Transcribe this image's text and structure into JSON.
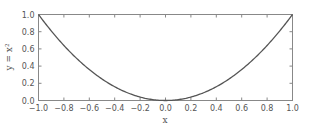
{
  "chart_data": {
    "type": "line",
    "title": "",
    "xlabel": "x",
    "ylabel": "y = x²",
    "xlim": [
      -1.0,
      1.0
    ],
    "ylim": [
      0.0,
      1.0
    ],
    "grid": false,
    "legend": null,
    "x_ticks": [
      "-1.0",
      "-0.8",
      "-0.6",
      "-0.4",
      "-0.2",
      "0.0",
      "0.2",
      "0.4",
      "0.6",
      "0.8",
      "1.0"
    ],
    "y_ticks": [
      "0.0",
      "0.2",
      "0.4",
      "0.6",
      "0.8",
      "1.0"
    ],
    "series": [
      {
        "name": "y = x^2",
        "x": [
          -1.0,
          -0.9,
          -0.8,
          -0.7,
          -0.6,
          -0.5,
          -0.4,
          -0.3,
          -0.2,
          -0.1,
          0.0,
          0.1,
          0.2,
          0.3,
          0.4,
          0.5,
          0.6,
          0.7,
          0.8,
          0.9,
          1.0
        ],
        "y": [
          1.0,
          0.81,
          0.64,
          0.49,
          0.36,
          0.25,
          0.16,
          0.09,
          0.04,
          0.01,
          0.0,
          0.01,
          0.04,
          0.09,
          0.16,
          0.25,
          0.36,
          0.49,
          0.64,
          0.81,
          1.0
        ],
        "color": "#555555"
      }
    ]
  },
  "style": {
    "frame_color": "#888888",
    "line_color": "#555555",
    "text_color": "#555555"
  }
}
